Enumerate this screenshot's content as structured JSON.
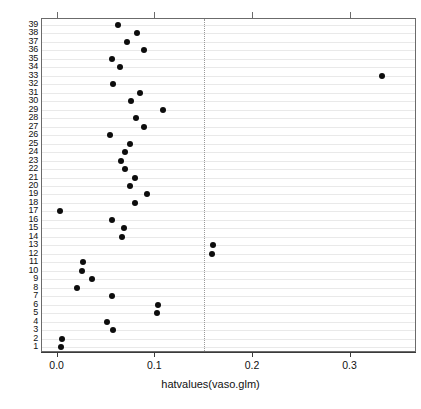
{
  "chart_data": {
    "type": "scatter",
    "title": "",
    "xlabel": "hatvalues(vaso.glm)",
    "ylabel": "",
    "xlim": [
      -0.016,
      0.368
    ],
    "ylim": [
      0.3,
      39.7
    ],
    "grid": "horizontal",
    "legend": null,
    "x_ticks": [
      {
        "value": 0.0,
        "label": "0.0"
      },
      {
        "value": 0.1,
        "label": "0.1"
      },
      {
        "value": 0.2,
        "label": "0.2"
      },
      {
        "value": 0.3,
        "label": "0.3"
      }
    ],
    "y_ticks": [
      {
        "value": 39,
        "label": "39"
      },
      {
        "value": 38,
        "label": "38"
      },
      {
        "value": 37,
        "label": "37"
      },
      {
        "value": 36,
        "label": "36"
      },
      {
        "value": 35,
        "label": "35"
      },
      {
        "value": 34,
        "label": "34"
      },
      {
        "value": 33,
        "label": "33"
      },
      {
        "value": 32,
        "label": "32"
      },
      {
        "value": 31,
        "label": "31"
      },
      {
        "value": 30,
        "label": "30"
      },
      {
        "value": 29,
        "label": "29"
      },
      {
        "value": 28,
        "label": "28"
      },
      {
        "value": 27,
        "label": "27"
      },
      {
        "value": 26,
        "label": "26"
      },
      {
        "value": 25,
        "label": "25"
      },
      {
        "value": 24,
        "label": "24"
      },
      {
        "value": 23,
        "label": "23"
      },
      {
        "value": 22,
        "label": "22"
      },
      {
        "value": 21,
        "label": "21"
      },
      {
        "value": 20,
        "label": "20"
      },
      {
        "value": 19,
        "label": "19"
      },
      {
        "value": 18,
        "label": "18"
      },
      {
        "value": 17,
        "label": "17"
      },
      {
        "value": 16,
        "label": "16"
      },
      {
        "value": 15,
        "label": "15"
      },
      {
        "value": 14,
        "label": "14"
      },
      {
        "value": 13,
        "label": "13"
      },
      {
        "value": 12,
        "label": "12"
      },
      {
        "value": 11,
        "label": "11"
      },
      {
        "value": 10,
        "label": "10"
      },
      {
        "value": 9,
        "label": "9"
      },
      {
        "value": 8,
        "label": "8"
      },
      {
        "value": 7,
        "label": "7"
      },
      {
        "value": 6,
        "label": "6"
      },
      {
        "value": 5,
        "label": "5"
      },
      {
        "value": 4,
        "label": "4"
      },
      {
        "value": 3,
        "label": "3"
      },
      {
        "value": 2,
        "label": "2"
      },
      {
        "value": 1,
        "label": "1"
      }
    ],
    "reference_lines": [
      {
        "orientation": "vertical",
        "value": 0.15,
        "style": "dotted",
        "color": "#9a9a9a"
      }
    ],
    "point_color": "#0d0d0d",
    "points": [
      {
        "y": 39,
        "x": 0.062
      },
      {
        "y": 38,
        "x": 0.081
      },
      {
        "y": 37,
        "x": 0.071
      },
      {
        "y": 36,
        "x": 0.088
      },
      {
        "y": 35,
        "x": 0.056
      },
      {
        "y": 34,
        "x": 0.064
      },
      {
        "y": 33,
        "x": 0.332
      },
      {
        "y": 32,
        "x": 0.057
      },
      {
        "y": 31,
        "x": 0.084
      },
      {
        "y": 30,
        "x": 0.075
      },
      {
        "y": 29,
        "x": 0.108
      },
      {
        "y": 28,
        "x": 0.08
      },
      {
        "y": 27,
        "x": 0.088
      },
      {
        "y": 26,
        "x": 0.054
      },
      {
        "y": 25,
        "x": 0.074
      },
      {
        "y": 24,
        "x": 0.069
      },
      {
        "y": 23,
        "x": 0.065
      },
      {
        "y": 22,
        "x": 0.069
      },
      {
        "y": 21,
        "x": 0.079
      },
      {
        "y": 20,
        "x": 0.074
      },
      {
        "y": 19,
        "x": 0.092
      },
      {
        "y": 18,
        "x": 0.079
      },
      {
        "y": 17,
        "x": 0.002
      },
      {
        "y": 16,
        "x": 0.056
      },
      {
        "y": 15,
        "x": 0.068
      },
      {
        "y": 14,
        "x": 0.066
      },
      {
        "y": 13,
        "x": 0.159
      },
      {
        "y": 12,
        "x": 0.158
      },
      {
        "y": 11,
        "x": 0.026
      },
      {
        "y": 10,
        "x": 0.025
      },
      {
        "y": 9,
        "x": 0.035
      },
      {
        "y": 8,
        "x": 0.02
      },
      {
        "y": 7,
        "x": 0.056
      },
      {
        "y": 6,
        "x": 0.103
      },
      {
        "y": 5,
        "x": 0.102
      },
      {
        "y": 4,
        "x": 0.051
      },
      {
        "y": 3,
        "x": 0.057
      },
      {
        "y": 2,
        "x": 0.004
      },
      {
        "y": 1,
        "x": 0.003
      }
    ]
  }
}
